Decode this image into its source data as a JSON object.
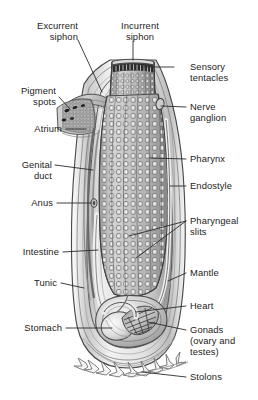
{
  "figure": {
    "background_color": "#ffffff",
    "ink_color": "#1c1c1c",
    "leader_color": "#2a2a2a"
  },
  "labels_left": [
    {
      "id": "excurrent-siphon",
      "text": "Excurrent\nsiphon",
      "align": "right"
    },
    {
      "id": "pigment-spots",
      "text": "Pigment\nspots",
      "align": "right"
    },
    {
      "id": "atrium",
      "text": "Atrium",
      "align": "right"
    },
    {
      "id": "genital-duct",
      "text": "Genital\nduct",
      "align": "right"
    },
    {
      "id": "anus",
      "text": "Anus",
      "align": "right"
    },
    {
      "id": "intestine",
      "text": "Intestine",
      "align": "right"
    },
    {
      "id": "tunic",
      "text": "Tunic",
      "align": "right"
    },
    {
      "id": "stomach",
      "text": "Stomach",
      "align": "right"
    }
  ],
  "labels_top": [
    {
      "id": "incurrent-siphon",
      "text": "Incurrent\nsiphon",
      "align": "left"
    }
  ],
  "labels_right": [
    {
      "id": "sensory-tentacles",
      "text": "Sensory\ntentacles",
      "align": "left"
    },
    {
      "id": "nerve-ganglion",
      "text": "Nerve\nganglion",
      "align": "left"
    },
    {
      "id": "pharynx",
      "text": "Pharynx",
      "align": "left"
    },
    {
      "id": "endostyle",
      "text": "Endostyle",
      "align": "left"
    },
    {
      "id": "pharyngeal-slits",
      "text": "Pharyngeal\nslits",
      "align": "left"
    },
    {
      "id": "mantle",
      "text": "Mantle",
      "align": "left"
    },
    {
      "id": "heart",
      "text": "Heart",
      "align": "left"
    },
    {
      "id": "gonads",
      "text": "Gonads\n(ovary and\ntestes)",
      "align": "left"
    },
    {
      "id": "stolons",
      "text": "Stolons",
      "align": "left"
    }
  ]
}
